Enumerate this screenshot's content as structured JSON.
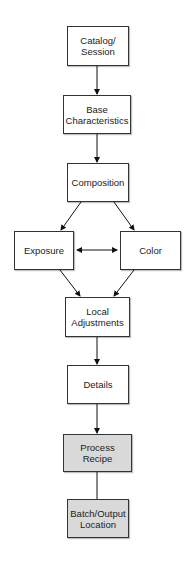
{
  "diagram": {
    "nodes": [
      {
        "id": "catalog",
        "label_line1": "Catalog/",
        "label_line2": "Session",
        "fill": "#ffffff"
      },
      {
        "id": "base",
        "label_line1": "Base",
        "label_line2": "Characteristics",
        "fill": "#ffffff"
      },
      {
        "id": "composition",
        "label_line1": "Composition",
        "label_line2": "",
        "fill": "#ffffff"
      },
      {
        "id": "exposure",
        "label_line1": "Exposure",
        "label_line2": "",
        "fill": "#ffffff"
      },
      {
        "id": "color",
        "label_line1": "Color",
        "label_line2": "",
        "fill": "#ffffff"
      },
      {
        "id": "local",
        "label_line1": "Local",
        "label_line2": "Adjustments",
        "fill": "#ffffff"
      },
      {
        "id": "details",
        "label_line1": "Details",
        "label_line2": "",
        "fill": "#ffffff"
      },
      {
        "id": "process",
        "label_line1": "Process",
        "label_line2": "Recipe",
        "fill": "#d9d9d9"
      },
      {
        "id": "batch",
        "label_line1": "Batch/Output",
        "label_line2": "Location",
        "fill": "#d9d9d9"
      }
    ],
    "edges": [
      {
        "from": "catalog",
        "to": "base",
        "type": "arrow"
      },
      {
        "from": "base",
        "to": "composition",
        "type": "arrow"
      },
      {
        "from": "composition",
        "to": "exposure",
        "type": "arrow"
      },
      {
        "from": "composition",
        "to": "color",
        "type": "arrow"
      },
      {
        "from": "exposure",
        "to": "color",
        "type": "bidirectional"
      },
      {
        "from": "exposure",
        "to": "local",
        "type": "arrow"
      },
      {
        "from": "color",
        "to": "local",
        "type": "arrow"
      },
      {
        "from": "local",
        "to": "details",
        "type": "arrow"
      },
      {
        "from": "details",
        "to": "process",
        "type": "arrow"
      },
      {
        "from": "process",
        "to": "batch",
        "type": "line"
      }
    ]
  }
}
